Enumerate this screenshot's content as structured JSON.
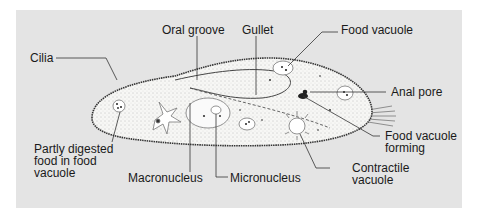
{
  "diagram": {
    "background_color": "#e4e4e4",
    "labels": {
      "cilia": "Cilia",
      "oral_groove": "Oral groove",
      "gullet": "Gullet",
      "food_vacuole": "Food vacuole",
      "anal_pore": "Anal pore",
      "partly_digested_1": "Partly digested",
      "partly_digested_2": "food in food",
      "partly_digested_3": "vacuole",
      "macronucleus": "Macronucleus",
      "micronucleus": "Micronucleus",
      "food_vacuole_forming_1": "Food vacuole",
      "food_vacuole_forming_2": "forming",
      "contractile_vacuole_1": "Contractile",
      "contractile_vacuole_2": "vacuole"
    }
  }
}
